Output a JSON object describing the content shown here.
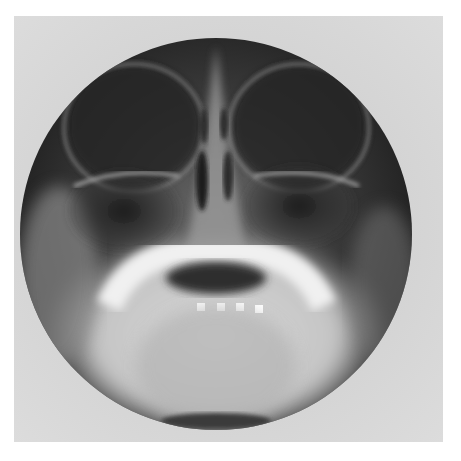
{
  "image": {
    "subject": "skull radiograph (occipitomental view)",
    "background_color": "#ffffff",
    "film_color": "#d2d2d2",
    "field_color": "#2a2a2a",
    "bone_color": "#e8e8e8"
  }
}
